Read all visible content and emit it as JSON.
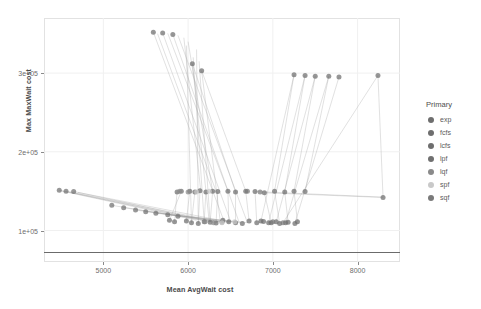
{
  "chart_data": {
    "type": "scatter",
    "title": "",
    "xlabel": "Mean AvgWait cost",
    "ylabel": "Max MaxWait cost",
    "xlim": [
      4300,
      8500
    ],
    "ylim": [
      60000,
      370000
    ],
    "xticks": [
      5000,
      6000,
      7000,
      8000
    ],
    "xticklabels": [
      "5000",
      "6000",
      "7000",
      "8000"
    ],
    "yticks": [
      100000,
      200000,
      300000
    ],
    "yticklabels": [
      "1e+05",
      "2e+05",
      "3e+05"
    ],
    "grid": true,
    "legend_position": "right",
    "legend_title": "Primary",
    "marker_color": "#5b5b5b",
    "line_color": "#9a9a9a",
    "panel_border_color": "#e2e2e2",
    "gridline_color": "#f0f0f0",
    "reference_line": {
      "orientation": "horizontal",
      "y": 72000,
      "color": "#6b6b6b"
    },
    "series": [
      {
        "name": "exp",
        "color": "#6e6e6e",
        "points": [
          [
            5590,
            352000
          ],
          [
            5700,
            351000
          ],
          [
            5820,
            349000
          ],
          [
            6050,
            312000
          ],
          [
            6160,
            303000
          ],
          [
            6020,
            150000
          ],
          [
            6080,
            149000
          ],
          [
            6140,
            150500
          ],
          [
            6210,
            149000
          ],
          [
            6290,
            150000
          ],
          [
            6350,
            149500
          ],
          [
            6470,
            150000
          ],
          [
            6560,
            149000
          ],
          [
            6680,
            150000
          ],
          [
            6790,
            149500
          ],
          [
            6900,
            148000
          ],
          [
            5980,
            112000
          ],
          [
            6040,
            110000
          ],
          [
            6120,
            109000
          ],
          [
            6190,
            111000
          ],
          [
            6260,
            110500
          ],
          [
            6330,
            109500
          ],
          [
            6410,
            113000
          ],
          [
            6480,
            111000
          ],
          [
            6560,
            110000
          ],
          [
            6640,
            109000
          ],
          [
            6720,
            112000
          ],
          [
            6810,
            110000
          ],
          [
            6890,
            111500
          ],
          [
            6980,
            110000
          ],
          [
            7080,
            109000
          ],
          [
            7180,
            110500
          ],
          [
            7290,
            111000
          ]
        ]
      },
      {
        "name": "fcfs",
        "color": "#6e6e6e",
        "points": [
          [
            7250,
            298000
          ],
          [
            7380,
            297000
          ],
          [
            7500,
            296000
          ],
          [
            7660,
            296000
          ],
          [
            7780,
            295000
          ],
          [
            7020,
            150000
          ],
          [
            7140,
            149000
          ],
          [
            7250,
            150000
          ],
          [
            7380,
            149500
          ],
          [
            6860,
            112000
          ],
          [
            6950,
            110000
          ],
          [
            7040,
            111000
          ],
          [
            7150,
            110000
          ],
          [
            7260,
            109000
          ]
        ]
      },
      {
        "name": "lcfs",
        "color": "#6e6e6e",
        "points": [
          [
            8240,
            297000
          ],
          [
            8300,
            142000
          ],
          [
            5920,
            150000
          ],
          [
            5870,
            149000
          ],
          [
            5780,
            113000
          ],
          [
            5840,
            111000
          ]
        ]
      },
      {
        "name": "lpf",
        "color": "#707070",
        "points": [
          [
            4480,
            151000
          ],
          [
            4560,
            150000
          ],
          [
            4650,
            149500
          ],
          [
            5100,
            132000
          ],
          [
            5240,
            129000
          ],
          [
            5380,
            126000
          ],
          [
            5500,
            124000
          ],
          [
            5620,
            122000
          ],
          [
            5760,
            120000
          ],
          [
            5880,
            118000
          ]
        ]
      },
      {
        "name": "lqf",
        "color": "#8a8a8a",
        "points": [
          [
            5900,
            150000
          ],
          [
            6000,
            149000
          ],
          [
            6200,
            111000
          ],
          [
            6300,
            110000
          ],
          [
            6400,
            110500
          ]
        ]
      },
      {
        "name": "spf",
        "color": "#c9c9c9",
        "points": [
          [
            6100,
            149000
          ],
          [
            6250,
            150000
          ],
          [
            6400,
            110000
          ],
          [
            6550,
            111000
          ]
        ]
      },
      {
        "name": "sqf",
        "color": "#7a7a7a",
        "points": [
          [
            6700,
            150000
          ],
          [
            6850,
            149000
          ],
          [
            7000,
            111000
          ],
          [
            7120,
            110000
          ]
        ]
      }
    ],
    "segments": [
      [
        5590,
        352000,
        6420,
        113000
      ],
      [
        5700,
        351000,
        6500,
        112000
      ],
      [
        5820,
        349000,
        6600,
        111000
      ],
      [
        5640,
        350000,
        6330,
        150000
      ],
      [
        5760,
        350500,
        6470,
        150000
      ],
      [
        5880,
        348000,
        6700,
        110000
      ],
      [
        6050,
        312000,
        6250,
        110500
      ],
      [
        6160,
        303000,
        6380,
        111000
      ],
      [
        6050,
        312000,
        6560,
        149000
      ],
      [
        6160,
        303000,
        6680,
        150000
      ],
      [
        5950,
        345000,
        6150,
        150000
      ],
      [
        6000,
        340000,
        6290,
        149500
      ],
      [
        6100,
        330000,
        6120,
        109000
      ],
      [
        5980,
        335000,
        6040,
        110000
      ],
      [
        6060,
        320000,
        6190,
        111000
      ],
      [
        6130,
        315000,
        6260,
        110500
      ],
      [
        7250,
        298000,
        6860,
        112000
      ],
      [
        7380,
        297000,
        6950,
        110000
      ],
      [
        7500,
        296000,
        7040,
        111000
      ],
      [
        7660,
        296000,
        7150,
        110000
      ],
      [
        7780,
        295000,
        7260,
        109000
      ],
      [
        7250,
        298000,
        7020,
        150000
      ],
      [
        7380,
        297000,
        7140,
        149000
      ],
      [
        7500,
        296000,
        7250,
        150000
      ],
      [
        7660,
        296000,
        7380,
        149500
      ],
      [
        8240,
        297000,
        7120,
        110000
      ],
      [
        8240,
        297000,
        8300,
        142000
      ],
      [
        4480,
        151000,
        6330,
        110000
      ],
      [
        4560,
        150000,
        6400,
        110500
      ],
      [
        4650,
        149500,
        6470,
        111000
      ],
      [
        4500,
        150500,
        6100,
        113000
      ],
      [
        4600,
        149000,
        6200,
        112000
      ],
      [
        4700,
        148500,
        6280,
        111500
      ],
      [
        5100,
        132000,
        6350,
        110000
      ],
      [
        5240,
        129000,
        6420,
        110500
      ],
      [
        5380,
        126000,
        6490,
        110000
      ],
      [
        5500,
        124000,
        6560,
        110500
      ],
      [
        5620,
        122000,
        6620,
        110000
      ],
      [
        5760,
        120000,
        6700,
        110000
      ],
      [
        6900,
        148000,
        8300,
        142000
      ],
      [
        6790,
        149500,
        8280,
        142500
      ],
      [
        5920,
        150000,
        5780,
        113000
      ],
      [
        5870,
        149000,
        5840,
        111000
      ],
      [
        6020,
        150000,
        5980,
        112000
      ],
      [
        6080,
        149000,
        6040,
        110000
      ],
      [
        6140,
        150500,
        6120,
        109000
      ],
      [
        6210,
        149000,
        6190,
        111000
      ],
      [
        6290,
        150000,
        6260,
        110500
      ],
      [
        6350,
        149500,
        6330,
        109500
      ],
      [
        6470,
        150000,
        6480,
        111000
      ],
      [
        6560,
        149000,
        6560,
        110000
      ],
      [
        6680,
        150000,
        6720,
        112000
      ],
      [
        6790,
        149500,
        6810,
        110000
      ],
      [
        6900,
        148000,
        6980,
        110000
      ],
      [
        7020,
        150000,
        7080,
        109000
      ],
      [
        7140,
        149000,
        7180,
        110500
      ],
      [
        7250,
        150000,
        7290,
        111000
      ]
    ]
  },
  "legend": {
    "title": "Primary",
    "items": [
      {
        "label": "exp",
        "color": "#6e6e6e"
      },
      {
        "label": "fcfs",
        "color": "#6e6e6e"
      },
      {
        "label": "lcfs",
        "color": "#6e6e6e"
      },
      {
        "label": "lpf",
        "color": "#707070"
      },
      {
        "label": "lqf",
        "color": "#8a8a8a"
      },
      {
        "label": "spf",
        "color": "#c9c9c9"
      },
      {
        "label": "sqf",
        "color": "#7a7a7a"
      }
    ]
  }
}
